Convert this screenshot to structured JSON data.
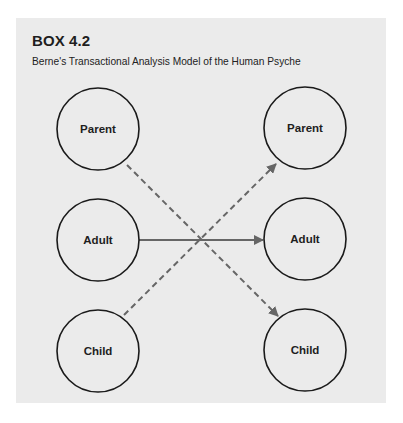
{
  "box": {
    "title": "BOX 4.2",
    "subtitle": "Berne's Transactional Analysis Model of the Human Psyche",
    "background": "#ebebeb"
  },
  "diagram": {
    "left_column": {
      "nodes": [
        {
          "id": "left-parent",
          "label": "Parent"
        },
        {
          "id": "left-adult",
          "label": "Adult"
        },
        {
          "id": "left-child",
          "label": "Child"
        }
      ]
    },
    "right_column": {
      "nodes": [
        {
          "id": "right-parent",
          "label": "Parent"
        },
        {
          "id": "right-adult",
          "label": "Adult"
        },
        {
          "id": "right-child",
          "label": "Child"
        }
      ]
    },
    "arrows": [
      {
        "from": "left-adult",
        "to": "right-adult",
        "style": "solid"
      },
      {
        "from": "left-parent",
        "to": "right-child",
        "style": "dashed"
      },
      {
        "from": "left-child",
        "to": "right-parent",
        "style": "dashed"
      }
    ],
    "colors": {
      "circle_stroke": "#1a1a1a",
      "arrow": "#666666"
    }
  }
}
